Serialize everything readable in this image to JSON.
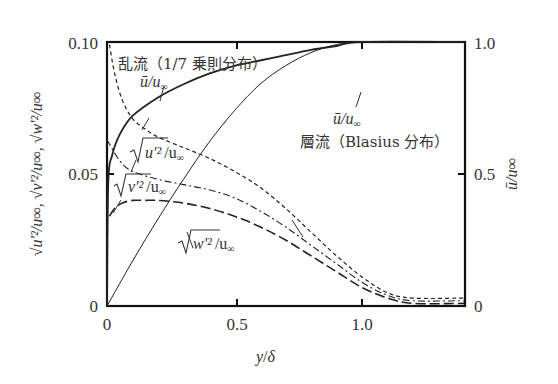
{
  "chart_data": {
    "type": "line",
    "title": "",
    "xlabel": "y/δ",
    "ylabel_left": "√(u'²)/u∞, √(v'²)/u∞, √(w'²)/u∞",
    "ylabel_right": "ū/u∞",
    "xlim": [
      0,
      1.4
    ],
    "ylim_left": [
      0,
      0.1
    ],
    "ylim_right": [
      0,
      1.0
    ],
    "x_ticks": [
      "0",
      "0.5",
      "1.0"
    ],
    "y_ticks_left": [
      "0",
      "0.05",
      "0.10"
    ],
    "y_ticks_right": [
      "0",
      "0.5",
      "1.0"
    ],
    "grid": false,
    "series": [
      {
        "name": "ū/u∞ 乱流 (1/7 乗則分布)",
        "axis": "right",
        "style": "solid-thick",
        "x": [
          0,
          0.005,
          0.02,
          0.05,
          0.1,
          0.2,
          0.3,
          0.4,
          0.5,
          0.6,
          0.7,
          0.8,
          0.9,
          1.0,
          1.4
        ],
        "y": [
          0,
          0.47,
          0.57,
          0.65,
          0.72,
          0.79,
          0.84,
          0.88,
          0.91,
          0.93,
          0.95,
          0.97,
          0.985,
          1.0,
          1.0
        ]
      },
      {
        "name": "ū/u∞ 層流 (Blasius 分布)",
        "axis": "right",
        "style": "solid-thin",
        "x": [
          0,
          0.1,
          0.2,
          0.3,
          0.4,
          0.5,
          0.6,
          0.7,
          0.8,
          0.9,
          1.0,
          1.4
        ],
        "y": [
          0,
          0.17,
          0.33,
          0.48,
          0.62,
          0.74,
          0.84,
          0.91,
          0.96,
          0.99,
          1.0,
          1.0
        ]
      },
      {
        "name": "√(u'²)/u∞",
        "axis": "left",
        "style": "short-dash",
        "x": [
          0.01,
          0.03,
          0.06,
          0.1,
          0.15,
          0.2,
          0.3,
          0.4,
          0.5,
          0.6,
          0.7,
          0.8,
          0.9,
          1.0,
          1.1,
          1.2,
          1.4
        ],
        "y": [
          0.099,
          0.088,
          0.078,
          0.071,
          0.067,
          0.064,
          0.06,
          0.056,
          0.051,
          0.045,
          0.037,
          0.028,
          0.019,
          0.011,
          0.005,
          0.003,
          0.003
        ]
      },
      {
        "name": "√(v'²)/u∞",
        "axis": "left",
        "style": "dash-dot",
        "x": [
          0.0,
          0.05,
          0.1,
          0.2,
          0.3,
          0.4,
          0.5,
          0.6,
          0.7,
          0.8,
          0.9,
          1.0,
          1.1,
          1.2,
          1.4
        ],
        "y": [
          0.063,
          0.055,
          0.051,
          0.048,
          0.046,
          0.044,
          0.041,
          0.036,
          0.03,
          0.023,
          0.016,
          0.009,
          0.004,
          0.002,
          0.002
        ]
      },
      {
        "name": "√(w'²)/u∞",
        "axis": "left",
        "style": "long-dash",
        "x": [
          0.01,
          0.03,
          0.06,
          0.1,
          0.15,
          0.2,
          0.3,
          0.4,
          0.5,
          0.6,
          0.7,
          0.8,
          0.9,
          1.0,
          1.1,
          1.2,
          1.4
        ],
        "y": [
          0.034,
          0.037,
          0.039,
          0.04,
          0.04,
          0.04,
          0.039,
          0.037,
          0.034,
          0.03,
          0.025,
          0.019,
          0.013,
          0.007,
          0.003,
          0.001,
          0.001
        ]
      }
    ],
    "annotations": [
      "乱流（1/7 乗則分布）",
      "層流（Blasius 分布）",
      "ū/u∞",
      "ū/u∞",
      "√(u'²)/u∞",
      "√(v'²)/u∞",
      "√(w'²)/u∞"
    ]
  },
  "labels": {
    "x_axis": {
      "var": "y",
      "slash": "/",
      "den": "δ"
    },
    "x_ticks": {
      "t0": "0",
      "t05": "0.5",
      "t10": "1.0"
    },
    "y_left_ticks": {
      "t0": "0",
      "t005": "0.05",
      "t010": "0.10"
    },
    "y_right_ticks": {
      "t0": "0",
      "t05": "0.5",
      "t10": "1.0"
    },
    "left_axis_title": "√u'²/u∞, √v'²/u∞, √w'²/u∞",
    "right_axis_title": "ū/u∞",
    "turbulent_label": "乱流（1/7 乗則分布）",
    "laminar_label_kanji": "層流",
    "laminar_label_rest": "（Blasius 分布）",
    "ubar_turb": "ū/u",
    "ubar_lam": "ū/u",
    "uprime": "u'²",
    "vprime": "v'²",
    "wprime": "w'²",
    "over_u": "/u",
    "inf": "∞"
  }
}
